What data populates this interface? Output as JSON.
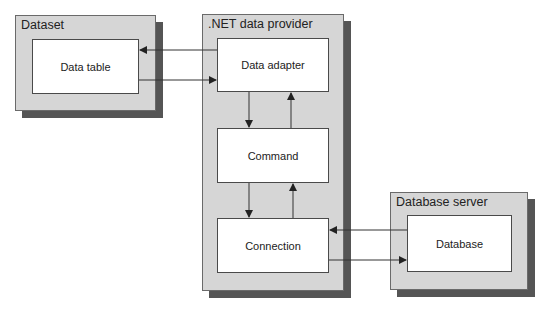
{
  "diagram": {
    "groups": {
      "dataset": {
        "title": "Dataset"
      },
      "provider": {
        "title": ".NET data provider"
      },
      "server": {
        "title": "Database server"
      }
    },
    "nodes": {
      "data_table": {
        "label": "Data table"
      },
      "data_adapter": {
        "label": "Data adapter"
      },
      "command": {
        "label": "Command"
      },
      "connection": {
        "label": "Connection"
      },
      "database": {
        "label": "Database"
      }
    },
    "edges": [
      {
        "from": "Data adapter",
        "to": "Data table"
      },
      {
        "from": "Data table",
        "to": "Data adapter"
      },
      {
        "from": "Data adapter",
        "to": "Command"
      },
      {
        "from": "Command",
        "to": "Data adapter"
      },
      {
        "from": "Command",
        "to": "Connection"
      },
      {
        "from": "Connection",
        "to": "Command"
      },
      {
        "from": "Database",
        "to": "Connection"
      },
      {
        "from": "Connection",
        "to": "Database"
      }
    ],
    "colors": {
      "group_fill": "#d6d6d6",
      "shadow": "#555555",
      "node_fill": "#ffffff",
      "line": "#333333"
    }
  }
}
